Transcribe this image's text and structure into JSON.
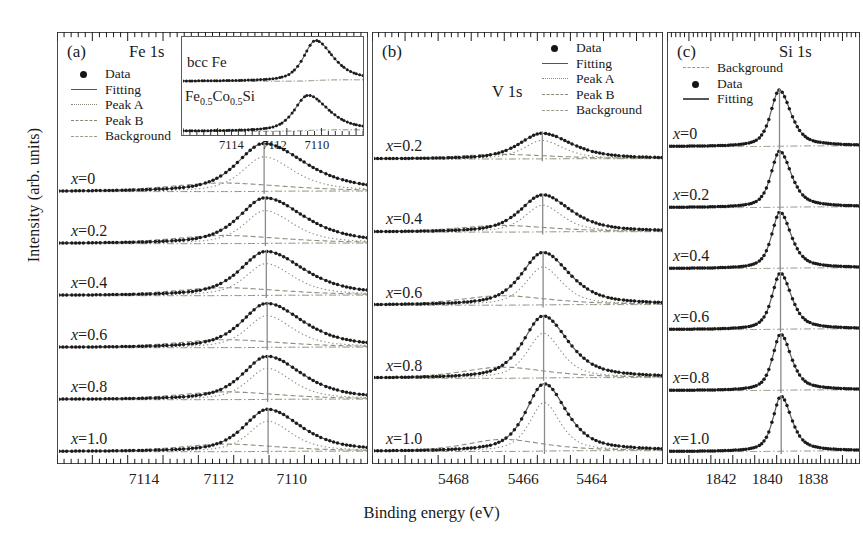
{
  "figure": {
    "axis_labels": {
      "y": "Intensity (arb. units)",
      "x": "Binding energy (eV)"
    }
  },
  "panels": [
    {
      "id": "a",
      "tag": "(a)",
      "title": "Fe 1s",
      "legend": [
        {
          "key": "dot",
          "label": "Data"
        },
        {
          "key": "solid",
          "label": "Fitting"
        },
        {
          "key": "dotted",
          "label": "Peak A"
        },
        {
          "key": "dashed",
          "label": "Peak B"
        },
        {
          "key": "dashdot",
          "label": "Background"
        }
      ],
      "xticks": [
        "7114",
        "7112",
        "7110"
      ],
      "xrange": [
        7115.6,
        7108.6
      ],
      "curves": [
        {
          "label_x": "x",
          "label_eq": "=",
          "label_v": "0",
          "peak": 7110.95,
          "amp": 1.0,
          "width": 0.72,
          "asym": 1.55
        },
        {
          "label_x": "x",
          "label_eq": "=",
          "label_v": "0.2",
          "peak": 7110.92,
          "amp": 0.95,
          "width": 0.7,
          "asym": 1.5
        },
        {
          "label_x": "x",
          "label_eq": "=",
          "label_v": "0.4",
          "peak": 7110.9,
          "amp": 0.92,
          "width": 0.69,
          "asym": 1.48
        },
        {
          "label_x": "x",
          "label_eq": "=",
          "label_v": "0.6",
          "peak": 7110.88,
          "amp": 0.92,
          "width": 0.67,
          "asym": 1.45
        },
        {
          "label_x": "x",
          "label_eq": "=",
          "label_v": "0.8",
          "peak": 7110.87,
          "amp": 0.9,
          "width": 0.66,
          "asym": 1.42
        },
        {
          "label_x": "x",
          "label_eq": "=",
          "label_v": "1.0",
          "peak": 7110.86,
          "amp": 0.88,
          "width": 0.64,
          "asym": 1.4
        }
      ],
      "inset": {
        "xticks": [
          "7114",
          "7112",
          "7110"
        ],
        "xrange": [
          7115.6,
          7108.6
        ],
        "curves": [
          {
            "label": "bcc Fe",
            "peak": 7110.45,
            "amp": 1.0,
            "width": 0.55,
            "asym": 1.45
          },
          {
            "label": "Fe0.5Co0.5Si",
            "peak": 7110.75,
            "amp": 0.88,
            "width": 0.62,
            "asym": 1.5
          }
        ]
      }
    },
    {
      "id": "b",
      "tag": "(b)",
      "title": "V 1s",
      "legend": [
        {
          "key": "dot",
          "label": "Data"
        },
        {
          "key": "solid",
          "label": "Fitting"
        },
        {
          "key": "dotted",
          "label": "Peak A"
        },
        {
          "key": "dashed",
          "label": "Peak B"
        },
        {
          "key": "dashdot",
          "label": "Background"
        }
      ],
      "xticks": [
        "5468",
        "5466",
        "5464"
      ],
      "xrange": [
        5469.3,
        5462.7
      ],
      "curves": [
        {
          "label_x": "x",
          "label_eq": "=",
          "label_v": "0.2",
          "peak": 5465.45,
          "amp": 0.38,
          "width": 0.62,
          "asym": 1.28
        },
        {
          "label_x": "x",
          "label_eq": "=",
          "label_v": "0.4",
          "peak": 5465.44,
          "amp": 0.55,
          "width": 0.6,
          "asym": 1.26
        },
        {
          "label_x": "x",
          "label_eq": "=",
          "label_v": "0.6",
          "peak": 5465.43,
          "amp": 0.78,
          "width": 0.58,
          "asym": 1.24
        },
        {
          "label_x": "x",
          "label_eq": "=",
          "label_v": "0.8",
          "peak": 5465.42,
          "amp": 0.92,
          "width": 0.55,
          "asym": 1.22
        },
        {
          "label_x": "x",
          "label_eq": "=",
          "label_v": "1.0",
          "peak": 5465.4,
          "amp": 1.0,
          "width": 0.5,
          "asym": 1.2
        }
      ]
    },
    {
      "id": "c",
      "tag": "(c)",
      "title": "Si 1s",
      "legend": [
        {
          "key": "dashdot",
          "label": "Background"
        },
        {
          "key": "dot",
          "label": "Data"
        },
        {
          "key": "solid",
          "label": "Fitting"
        }
      ],
      "xticks": [
        "1842",
        "1840",
        "1838"
      ],
      "xrange": [
        1842.9,
        1837.3
      ],
      "curves": [
        {
          "label_x": "x",
          "label_eq": "=",
          "label_v": "0",
          "peak": 1839.65,
          "amp": 1.0,
          "width": 0.3,
          "asym": 1.35
        },
        {
          "label_x": "x",
          "label_eq": "=",
          "label_v": "0.2",
          "peak": 1839.64,
          "amp": 1.0,
          "width": 0.3,
          "asym": 1.35
        },
        {
          "label_x": "x",
          "label_eq": "=",
          "label_v": "0.4",
          "peak": 1839.63,
          "amp": 1.0,
          "width": 0.29,
          "asym": 1.34
        },
        {
          "label_x": "x",
          "label_eq": "=",
          "label_v": "0.6",
          "peak": 1839.62,
          "amp": 1.0,
          "width": 0.29,
          "asym": 1.33
        },
        {
          "label_x": "x",
          "label_eq": "=",
          "label_v": "0.8",
          "peak": 1839.61,
          "amp": 1.0,
          "width": 0.28,
          "asym": 1.32
        },
        {
          "label_x": "x",
          "label_eq": "=",
          "label_v": "1.0",
          "peak": 1839.6,
          "amp": 0.98,
          "width": 0.28,
          "asym": 1.32
        }
      ]
    }
  ],
  "chart_data": {
    "type": "line",
    "title": "",
    "xlabel": "Binding energy (eV)",
    "ylabel": "Intensity (arb. units)",
    "grid": false,
    "legend_position": "inside-top",
    "note": "Three stacked-offset XPS/HAXPES core-level panels; binding energy axis decreases to the right.",
    "panels": [
      {
        "panel": "a",
        "core_level": "Fe 1s",
        "xlim": [
          7115.6,
          7108.6
        ],
        "xticks": [
          7114,
          7112,
          7110
        ],
        "series_names": [
          "Data",
          "Fitting",
          "Peak A",
          "Peak B",
          "Background"
        ],
        "curves": [
          {
            "name": "x=0",
            "peak_position_eV": 7110.95,
            "relative_peak_height": 1.0,
            "fwhm_eV": 1.44
          },
          {
            "name": "x=0.2",
            "peak_position_eV": 7110.92,
            "relative_peak_height": 0.95,
            "fwhm_eV": 1.4
          },
          {
            "name": "x=0.4",
            "peak_position_eV": 7110.9,
            "relative_peak_height": 0.92,
            "fwhm_eV": 1.38
          },
          {
            "name": "x=0.6",
            "peak_position_eV": 7110.88,
            "relative_peak_height": 0.92,
            "fwhm_eV": 1.34
          },
          {
            "name": "x=0.8",
            "peak_position_eV": 7110.87,
            "relative_peak_height": 0.9,
            "fwhm_eV": 1.32
          },
          {
            "name": "x=1.0",
            "peak_position_eV": 7110.86,
            "relative_peak_height": 0.88,
            "fwhm_eV": 1.28
          }
        ],
        "inset": {
          "xlim": [
            7115.6,
            7108.6
          ],
          "xticks": [
            7114,
            7112,
            7110
          ],
          "curves": [
            {
              "name": "bcc Fe",
              "peak_position_eV": 7110.45,
              "relative_peak_height": 1.0
            },
            {
              "name": "Fe0.5Co0.5Si",
              "peak_position_eV": 7110.75,
              "relative_peak_height": 0.88
            }
          ]
        }
      },
      {
        "panel": "b",
        "core_level": "V 1s",
        "xlim": [
          5469.3,
          5462.7
        ],
        "xticks": [
          5468,
          5466,
          5464
        ],
        "series_names": [
          "Data",
          "Fitting",
          "Peak A",
          "Peak B",
          "Background"
        ],
        "curves": [
          {
            "name": "x=0.2",
            "peak_position_eV": 5465.45,
            "relative_peak_height": 0.38
          },
          {
            "name": "x=0.4",
            "peak_position_eV": 5465.44,
            "relative_peak_height": 0.55
          },
          {
            "name": "x=0.6",
            "peak_position_eV": 5465.43,
            "relative_peak_height": 0.78
          },
          {
            "name": "x=0.8",
            "peak_position_eV": 5465.42,
            "relative_peak_height": 0.92
          },
          {
            "name": "x=1.0",
            "peak_position_eV": 5465.4,
            "relative_peak_height": 1.0
          }
        ]
      },
      {
        "panel": "c",
        "core_level": "Si 1s",
        "xlim": [
          1842.9,
          1837.3
        ],
        "xticks": [
          1842,
          1840,
          1838
        ],
        "series_names": [
          "Background",
          "Data",
          "Fitting"
        ],
        "curves": [
          {
            "name": "x=0",
            "peak_position_eV": 1839.65,
            "relative_peak_height": 1.0
          },
          {
            "name": "x=0.2",
            "peak_position_eV": 1839.64,
            "relative_peak_height": 1.0
          },
          {
            "name": "x=0.4",
            "peak_position_eV": 1839.63,
            "relative_peak_height": 1.0
          },
          {
            "name": "x=0.6",
            "peak_position_eV": 1839.62,
            "relative_peak_height": 1.0
          },
          {
            "name": "x=0.8",
            "peak_position_eV": 1839.61,
            "relative_peak_height": 1.0
          },
          {
            "name": "x=1.0",
            "peak_position_eV": 1839.6,
            "relative_peak_height": 0.98
          }
        ]
      }
    ]
  }
}
